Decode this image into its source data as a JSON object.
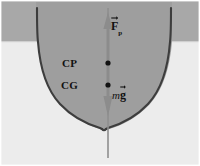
{
  "figure": {
    "labels": {
      "buoyancy_symbol": "F",
      "buoyancy_subscript": "p",
      "center_of_pressure": "CP",
      "center_of_gravity": "CG",
      "weight_mass_symbol": "m",
      "weight_gravity_symbol": "g"
    },
    "colors": {
      "air": "#a8a8a8",
      "water": "#eaeaea",
      "hull_fill": "#9e9e9e",
      "hull_outline": "#3d3d3d",
      "axis_line": "#8c8c8c",
      "arrow_fill": "#8c8c8c",
      "marker_dot": "#111111",
      "text": "#111111",
      "page_background": "#ffffff"
    },
    "geometry": {
      "waterline_y": 41,
      "axis_x": 108,
      "axis_top_y": 8,
      "axis_bottom_y": 158,
      "buoyancy_arrow_tip_y": 24,
      "weight_arrow_tip_y": 113,
      "cp_point": {
        "x": 108,
        "y": 63
      },
      "cg_point": {
        "x": 108,
        "y": 85
      },
      "hull_left_gunwale_x": 36,
      "hull_right_gunwale_x": 172,
      "hull_gunwale_y": 42,
      "keel_tip": {
        "x": 101,
        "y": 129
      }
    }
  }
}
